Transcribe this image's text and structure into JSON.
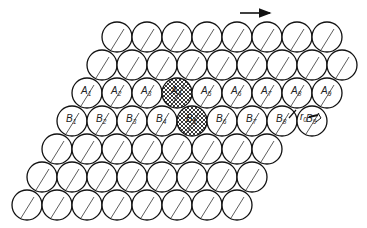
{
  "figure": {
    "arrow_direction": "right",
    "radius": 15,
    "spacing": 30,
    "rows": [
      {
        "y": 37,
        "x_start": 117,
        "count": 8,
        "labels": []
      },
      {
        "y": 65,
        "x_start": 102,
        "count": 9,
        "labels": []
      },
      {
        "y": 93,
        "x_start": 87,
        "count": 9,
        "labels": [
          "A1",
          "A2",
          "A3",
          "A4",
          "A5",
          "A6",
          "A7",
          "A8",
          "A9"
        ]
      },
      {
        "y": 121,
        "x_start": 72,
        "count": 9,
        "labels": [
          "B1",
          "B2",
          "B3",
          "B4",
          "B5",
          "B6",
          "B7",
          "B8",
          "B9"
        ]
      },
      {
        "y": 149,
        "x_start": 57,
        "count": 8,
        "labels": []
      },
      {
        "y": 177,
        "x_start": 42,
        "count": 8,
        "labels": []
      },
      {
        "y": 205,
        "x_start": 27,
        "count": 8,
        "labels": []
      }
    ],
    "hatched": [
      "A4",
      "B5"
    ],
    "annotation": {
      "label": "r",
      "subscript": "0"
    }
  }
}
